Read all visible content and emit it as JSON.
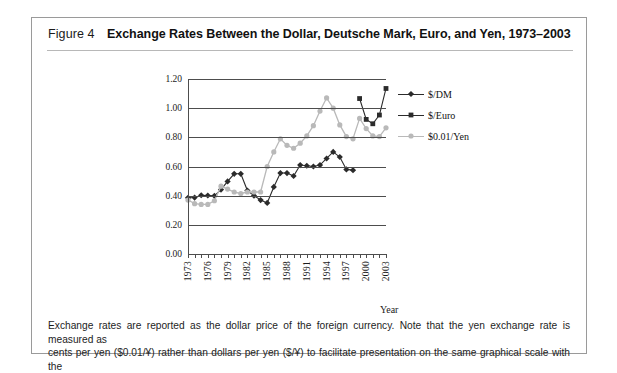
{
  "figure": {
    "label": "Figure 4",
    "title": "Exchange Rates Between the Dollar, Deutsche Mark, Euro, and Yen, 1973–2003",
    "caption_line1": "Exchange rates are reported as the dollar price of the foreign currency. Note that the yen exchange rate is measured as",
    "caption_line2": "cents per yen ($0.01/¥) rather than dollars per yen ($/¥) to facilitate presentation on the same graphical scale with the"
  },
  "colors": {
    "dm": "#2b2b2b",
    "euro": "#2b2b2b",
    "yen": "#b9b9b9",
    "grid": "#4d4d4d",
    "border": "#9a9a9a",
    "text": "#1b1b1b"
  },
  "chart_data": {
    "type": "line",
    "title": "Exchange Rates Between the Dollar, Deutsche Mark, Euro, and Yen, 1973–2003",
    "xlabel": "Year",
    "ylabel": "",
    "xlim": [
      1973,
      2003
    ],
    "ylim": [
      0.0,
      1.2
    ],
    "yticks": [
      "0.00",
      "0.20",
      "0.40",
      "0.60",
      "0.80",
      "1.00",
      "1.20"
    ],
    "ytick_values": [
      0.0,
      0.2,
      0.4,
      0.6,
      0.8,
      1.0,
      1.2
    ],
    "xticks_labeled": [
      1973,
      1976,
      1979,
      1982,
      1985,
      1988,
      1991,
      1994,
      1997,
      2000,
      2003
    ],
    "xticks_all_years": [
      1973,
      1974,
      1975,
      1976,
      1977,
      1978,
      1979,
      1980,
      1981,
      1982,
      1983,
      1984,
      1985,
      1986,
      1987,
      1988,
      1989,
      1990,
      1991,
      1992,
      1993,
      1994,
      1995,
      1996,
      1997,
      1998,
      1999,
      2000,
      2001,
      2002,
      2003
    ],
    "grid": "horizontal",
    "legend_position": "right",
    "series": [
      {
        "name": "$/DM",
        "marker": "diamond",
        "color": "#2b2b2b",
        "x": [
          1973,
          1974,
          1975,
          1976,
          1977,
          1978,
          1979,
          1980,
          1981,
          1982,
          1983,
          1984,
          1985,
          1986,
          1987,
          1988,
          1989,
          1990,
          1991,
          1992,
          1993,
          1994,
          1995,
          1996,
          1997,
          1998
        ],
        "values": [
          0.385,
          0.387,
          0.403,
          0.401,
          0.399,
          0.442,
          0.498,
          0.55,
          0.55,
          0.435,
          0.4,
          0.37,
          0.35,
          0.46,
          0.555,
          0.555,
          0.535,
          0.61,
          0.605,
          0.6,
          0.61,
          0.655,
          0.7,
          0.665,
          0.58,
          0.575
        ]
      },
      {
        "name": "$/Euro",
        "marker": "square",
        "color": "#2b2b2b",
        "x": [
          1999,
          2000,
          2001,
          2002,
          2003
        ],
        "values": [
          1.066,
          0.923,
          0.893,
          0.953,
          1.135
        ]
      },
      {
        "name": "$0.01/Yen",
        "marker": "circle",
        "color": "#b9b9b9",
        "x": [
          1973,
          1974,
          1975,
          1976,
          1977,
          1978,
          1979,
          1980,
          1981,
          1982,
          1983,
          1984,
          1985,
          1986,
          1987,
          1988,
          1989,
          1990,
          1991,
          1992,
          1993,
          1994,
          1995,
          1996,
          1997,
          1998,
          1999,
          2000,
          2001,
          2002,
          2003
        ],
        "values": [
          0.37,
          0.345,
          0.34,
          0.34,
          0.365,
          0.465,
          0.445,
          0.425,
          0.415,
          0.425,
          0.425,
          0.425,
          0.6,
          0.7,
          0.79,
          0.745,
          0.725,
          0.76,
          0.81,
          0.88,
          0.98,
          1.07,
          1.0,
          0.885,
          0.805,
          0.79,
          0.93,
          0.86,
          0.81,
          0.805,
          0.865
        ]
      }
    ]
  },
  "legend": [
    {
      "label": "$/DM",
      "marker": "diamond",
      "color": "#2b2b2b"
    },
    {
      "label": "$/Euro",
      "marker": "square",
      "color": "#2b2b2b"
    },
    {
      "label": "$0.01/Yen",
      "marker": "circle",
      "color": "#b9b9b9"
    }
  ],
  "axis": {
    "year_label": "Year"
  }
}
